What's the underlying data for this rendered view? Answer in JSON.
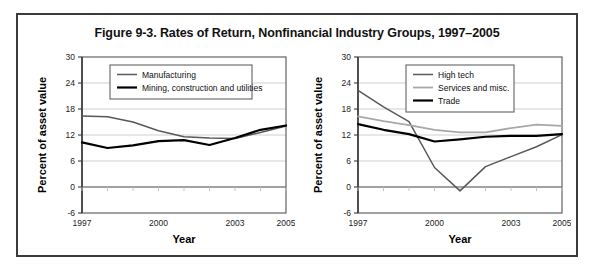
{
  "figure": {
    "title": "Figure 9-3. Rates of Return, Nonfinancial Industry Groups, 1997–2005",
    "frame_color": "#3b3b3b",
    "background": "#ffffff"
  },
  "chart_data": [
    {
      "type": "line",
      "panel": "left",
      "title": "",
      "xlabel": "Year",
      "ylabel": "Percent of asset value",
      "x": [
        1997,
        1998,
        1999,
        2000,
        2001,
        2002,
        2003,
        2004,
        2005
      ],
      "xlim": [
        1997,
        2005
      ],
      "xticks": [
        1997,
        2000,
        2003,
        2005
      ],
      "xtick_labels": [
        "1997",
        "2000",
        "2003",
        "2005"
      ],
      "ylim": [
        -6,
        30
      ],
      "yticks": [
        -6,
        0,
        6,
        12,
        18,
        24,
        30
      ],
      "ytick_labels": [
        "-6",
        "0",
        "6",
        "12",
        "18",
        "24",
        "30"
      ],
      "grid": true,
      "legend_position": "top-center",
      "series": [
        {
          "name": "Manufacturing",
          "color": "#585858",
          "width": 1.5,
          "values": [
            16.4,
            16.2,
            15.0,
            13.0,
            11.6,
            11.3,
            11.2,
            12.6,
            14.1
          ]
        },
        {
          "name": "Mining, construction and utilities",
          "color": "#000000",
          "width": 2.2,
          "values": [
            10.3,
            9.0,
            9.6,
            10.6,
            10.8,
            9.7,
            11.3,
            13.2,
            14.2
          ]
        }
      ]
    },
    {
      "type": "line",
      "panel": "right",
      "title": "",
      "xlabel": "Year",
      "ylabel": "Percent of asset value",
      "x": [
        1997,
        1998,
        1999,
        2000,
        2001,
        2002,
        2003,
        2004,
        2005
      ],
      "xlim": [
        1997,
        2005
      ],
      "xticks": [
        1997,
        2000,
        2003,
        2005
      ],
      "xtick_labels": [
        "1997",
        "2000",
        "2003",
        "2005"
      ],
      "ylim": [
        -6,
        30
      ],
      "yticks": [
        -6,
        0,
        6,
        12,
        18,
        24,
        30
      ],
      "ytick_labels": [
        "-6",
        "0",
        "6",
        "12",
        "18",
        "24",
        "30"
      ],
      "grid": true,
      "legend_position": "top-center",
      "series": [
        {
          "name": "High tech",
          "color": "#585858",
          "width": 1.5,
          "values": [
            22.3,
            18.5,
            15.1,
            4.5,
            -0.9,
            4.7,
            7.0,
            9.3,
            12.1
          ]
        },
        {
          "name": "Services and misc.",
          "color": "#a8a8a8",
          "width": 1.8,
          "values": [
            16.3,
            15.2,
            14.3,
            13.2,
            12.6,
            12.6,
            13.6,
            14.4,
            14.1
          ]
        },
        {
          "name": "Trade",
          "color": "#000000",
          "width": 2.2,
          "values": [
            14.5,
            13.2,
            12.2,
            10.5,
            11.0,
            11.6,
            11.8,
            11.8,
            12.2
          ]
        }
      ]
    }
  ]
}
